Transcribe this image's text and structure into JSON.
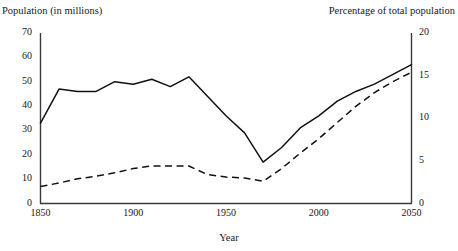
{
  "figure": {
    "cut_off_top_text": "",
    "left_axis_title": "Population (in millions)",
    "right_axis_title": "Percentage of total population",
    "x_axis_title": "Year"
  },
  "ticks": {
    "left": [
      "70",
      "60",
      "50",
      "40",
      "30",
      "20",
      "10",
      "0"
    ],
    "right": [
      "20",
      "15",
      "10",
      "5",
      "0"
    ],
    "bottom": [
      "1850",
      "1900",
      "1950",
      "2000",
      "2050"
    ]
  },
  "colors": {
    "line": "#111111",
    "axis": "#3a3a3a",
    "background": "#ffffff",
    "text": "#17171a"
  },
  "chart_data": {
    "type": "line",
    "title": "",
    "xlabel": "Year",
    "ylabel": "Population (in millions)",
    "y2label": "Percentage of total population",
    "xlim": [
      1840,
      2055
    ],
    "ylim": [
      0,
      70
    ],
    "y2lim": [
      0,
      20
    ],
    "grid": false,
    "legend": "none",
    "xticks": [
      1850,
      1900,
      1950,
      2000,
      2050
    ],
    "yticks": [
      0,
      10,
      20,
      30,
      40,
      50,
      60,
      70
    ],
    "y2ticks": [
      0,
      5,
      10,
      15,
      20
    ],
    "series": [
      {
        "name": "Population (in millions)",
        "style": "solid",
        "axis": "left",
        "x": [
          1850,
          1860,
          1870,
          1880,
          1890,
          1900,
          1910,
          1920,
          1930,
          1940,
          1950,
          1960,
          1970,
          1980,
          1990,
          2000,
          2010,
          2020,
          2030,
          2040,
          2050
        ],
        "values": [
          33,
          47,
          46,
          46,
          50,
          49,
          51,
          48,
          52,
          44,
          36,
          29,
          17,
          23,
          31,
          36,
          42,
          46,
          49,
          53,
          57
        ]
      },
      {
        "name": "Percentage of total population",
        "style": "dashed",
        "axis": "right",
        "x": [
          1850,
          1860,
          1870,
          1880,
          1890,
          1900,
          1910,
          1920,
          1930,
          1940,
          1950,
          1960,
          1970,
          1980,
          1990,
          2000,
          2010,
          2020,
          2030,
          2040,
          2050
        ],
        "values": [
          2.0,
          2.4,
          2.9,
          3.2,
          3.6,
          4.1,
          4.4,
          4.4,
          4.4,
          3.4,
          3.1,
          3.0,
          2.6,
          4.1,
          5.9,
          7.6,
          9.5,
          11.4,
          13.0,
          14.3,
          15.4
        ]
      }
    ]
  }
}
